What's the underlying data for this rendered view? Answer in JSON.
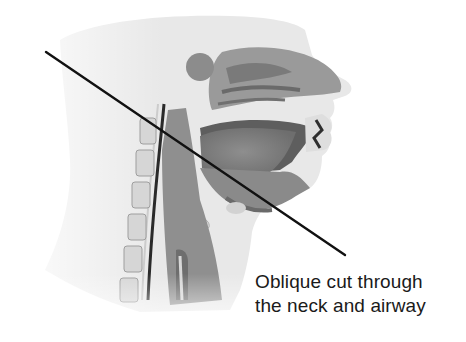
{
  "figure": {
    "caption": {
      "line1": "Oblique cut through",
      "line2": "the neck and airway"
    },
    "cut_line": {
      "x1": 46,
      "y1": 52,
      "x2": 345,
      "y2": 255,
      "color": "#111111"
    },
    "colors": {
      "background": "#ffffff",
      "skin": "#e6e6e6",
      "tissue_mid": "#b8b8b8",
      "cavity": "#8a8a8a",
      "dark": "#4a4a4a",
      "bone_light": "#d4d4d4"
    }
  }
}
